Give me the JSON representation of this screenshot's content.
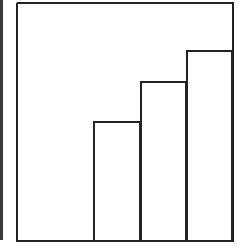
{
  "chart_data": {
    "type": "bar",
    "title": "",
    "xlabel": "",
    "ylabel": "",
    "categories": [
      "1",
      "2",
      "3",
      "4"
    ],
    "values": [
      0,
      50,
      67,
      80
    ],
    "ylim": [
      0,
      100
    ],
    "grid": false,
    "legend": null,
    "colors": {
      "stroke": "#222222",
      "fill": "#ffffff"
    }
  }
}
